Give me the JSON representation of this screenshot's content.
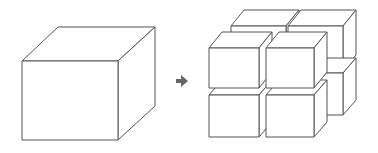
{
  "diagram": {
    "colors": {
      "stroke": "#555555",
      "arrow": "#666666",
      "background": "#ffffff",
      "face": "#ffffff"
    },
    "source": {
      "label": "",
      "shape": "large-cube"
    },
    "arrow": {
      "icon": "right-arrow-icon",
      "glyph": "➜"
    },
    "result": {
      "label": "",
      "shape": "split-cubes",
      "count": 8,
      "grid": "2x2x2"
    }
  }
}
